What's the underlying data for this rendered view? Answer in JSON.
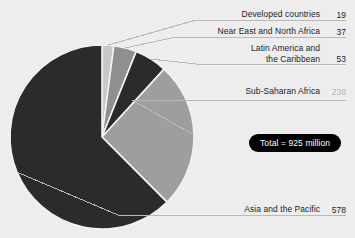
{
  "chart_data": {
    "type": "pie",
    "title": "",
    "total_label": "Total = 925 million",
    "total_value": 925,
    "units": "million",
    "legend_position": "callout-labels-right",
    "categories": [
      "Developed countries",
      "Near East and North Africa",
      "Latin America and the Caribbean",
      "Sub-Saharan Africa",
      "Asia and the Pacific"
    ],
    "values": [
      19,
      37,
      53,
      238,
      578
    ],
    "start_angle_deg": 0,
    "direction": "clockwise",
    "slices": [
      {
        "label": "Developed countries",
        "value": 19,
        "color": "#c8c8ca"
      },
      {
        "label": "Near East and North Africa",
        "value": 37,
        "color": "#8f8f92"
      },
      {
        "label": "Latin America and the Caribbean",
        "value": 53,
        "color": "#2b2b2d"
      },
      {
        "label": "Sub-Saharan Africa",
        "value": 238,
        "color": "#9e9ea0"
      },
      {
        "label": "Asia and the Pacific",
        "value": 578,
        "color": "#2b2b2d"
      }
    ]
  },
  "callouts": {
    "developed": {
      "label": "Developed countries",
      "value": "19"
    },
    "neareast": {
      "label": "Near East and North Africa",
      "value": "37"
    },
    "latin": {
      "label": "Latin America and\nthe Caribbean",
      "value": "53"
    },
    "subsaharan": {
      "label": "Sub-Saharan Africa",
      "value": "238"
    },
    "asia": {
      "label": "Asia and the Pacific",
      "value": "578"
    }
  },
  "colors": {
    "background": "#ededee",
    "dark_slice": "#2b2b2d",
    "light_slice": "#9e9ea0",
    "pale_slice": "#c8c8ca",
    "mid_slice": "#8f8f92",
    "separator": "#f2f2f3",
    "leader_line": "#b9b9bb",
    "badge_background": "#000000",
    "badge_text": "#ffffff",
    "label_text": "#1d1d1f"
  }
}
